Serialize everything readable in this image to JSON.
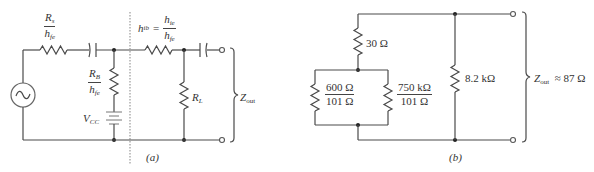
{
  "figure_a": {
    "caption": "(a)",
    "source_resistor": {
      "num_main": "R",
      "num_sub": "s",
      "den_main": "h",
      "den_sub": "fe"
    },
    "base_resistor": {
      "num_main": "R",
      "num_sub": "B",
      "den_main": "h",
      "den_sub": "fe"
    },
    "supply": {
      "main": "V",
      "sub": "CC"
    },
    "emitter_resistor": {
      "lhs_main": "h",
      "lhs_sub": "ib",
      "eq": "=",
      "num_main": "h",
      "num_sub": "ie",
      "den_main": "h",
      "den_sub": "fe"
    },
    "load": {
      "main": "R",
      "sub": "L"
    },
    "output": {
      "main": "Z",
      "sub": "out"
    }
  },
  "figure_b": {
    "caption": "(b)",
    "series_resistor": "30 Ω",
    "left_parallel": {
      "num": "600 Ω",
      "den": "101 Ω"
    },
    "right_parallel": {
      "num": "750 kΩ",
      "den": "101 Ω"
    },
    "shunt_resistor": "8.2 kΩ",
    "output": {
      "main": "Z",
      "sub": "out",
      "rest": "≈ 87 Ω"
    }
  },
  "colors": {
    "wire": "#4a4a4a",
    "dashed_divider": "#999999",
    "text": "#333333"
  }
}
